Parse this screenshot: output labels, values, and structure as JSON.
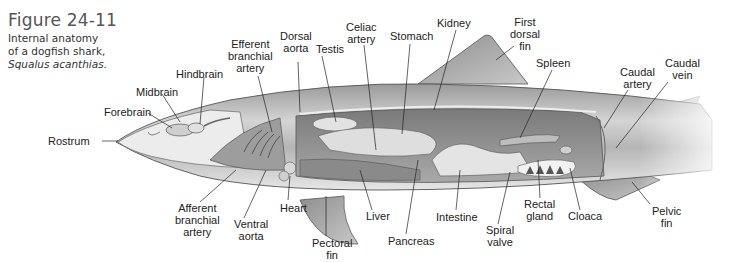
{
  "figure": {
    "number": "Figure 24-11",
    "description_line1": "Internal anatomy",
    "description_line2": "of a dogfish shark,",
    "species": "Squalus acanthias."
  },
  "labels": [
    {
      "id": "rostrum",
      "text": "Rostrum",
      "x": 48,
      "y": 134
    },
    {
      "id": "forebrain",
      "text": "Forebrain",
      "x": 104,
      "y": 106
    },
    {
      "id": "midbrain",
      "text": "Midbrain",
      "x": 136,
      "y": 86
    },
    {
      "id": "hindbrain",
      "text": "Hindbrain",
      "x": 176,
      "y": 68
    },
    {
      "id": "efferent-branchial-artery",
      "text": "Efferent\nbranchial\nartery",
      "x": 226,
      "y": 38
    },
    {
      "id": "dorsal-aorta",
      "text": "Dorsal\naorta",
      "x": 280,
      "y": 30
    },
    {
      "id": "testis",
      "text": "Testis",
      "x": 318,
      "y": 43
    },
    {
      "id": "celiac-artery",
      "text": "Celiac\nartery",
      "x": 346,
      "y": 21
    },
    {
      "id": "stomach",
      "text": "Stomach",
      "x": 392,
      "y": 30
    },
    {
      "id": "kidney",
      "text": "Kidney",
      "x": 437,
      "y": 17
    },
    {
      "id": "first-dorsal-fin",
      "text": "First\ndorsal\nfin",
      "x": 510,
      "y": 16
    },
    {
      "id": "spleen",
      "text": "Spleen",
      "x": 538,
      "y": 57
    },
    {
      "id": "caudal-artery",
      "text": "Caudal\nartery",
      "x": 620,
      "y": 66
    },
    {
      "id": "caudal-vein",
      "text": "Caudal\nvein",
      "x": 665,
      "y": 57
    },
    {
      "id": "afferent-branchial-artery",
      "text": "Afferent\nbranchial\nartery",
      "x": 174,
      "y": 202
    },
    {
      "id": "ventral-aorta",
      "text": "Ventral\naorta",
      "x": 234,
      "y": 218
    },
    {
      "id": "heart",
      "text": "Heart",
      "x": 280,
      "y": 200
    },
    {
      "id": "pectoral-fin",
      "text": "Pectoral\nfin",
      "x": 312,
      "y": 236
    },
    {
      "id": "liver",
      "text": "Liver",
      "x": 366,
      "y": 210
    },
    {
      "id": "pancreas",
      "text": "Pancreas",
      "x": 388,
      "y": 235
    },
    {
      "id": "intestine",
      "text": "Intestine",
      "x": 436,
      "y": 210
    },
    {
      "id": "spiral-valve",
      "text": "Spiral\nvalve",
      "x": 486,
      "y": 224
    },
    {
      "id": "rectal-gland",
      "text": "Rectal\ngland",
      "x": 525,
      "y": 198
    },
    {
      "id": "cloaca",
      "text": "Cloaca",
      "x": 572,
      "y": 210
    },
    {
      "id": "pelvic-fin",
      "text": "Pelvic\nfin",
      "x": 652,
      "y": 205
    }
  ]
}
